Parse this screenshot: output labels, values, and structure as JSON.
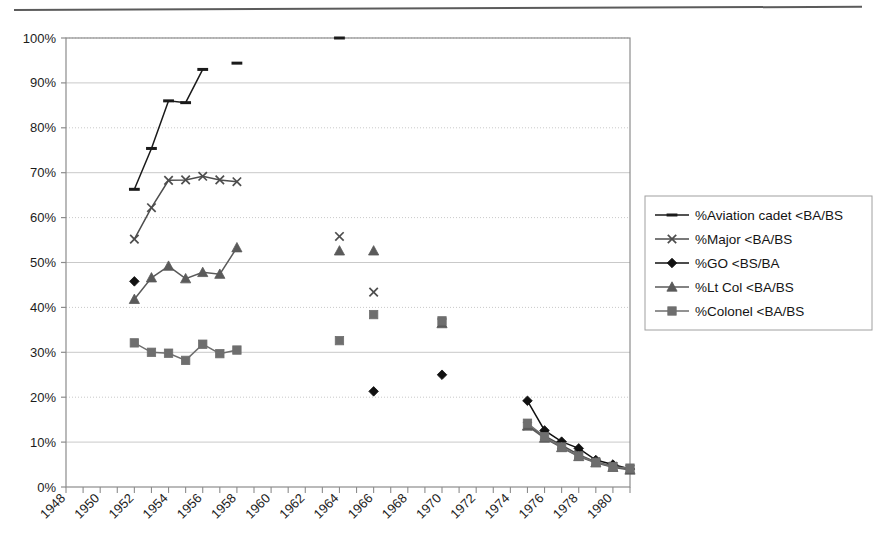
{
  "chart_data": {
    "type": "line",
    "title": "",
    "xlabel": "",
    "ylabel": "",
    "xlim": [
      1948,
      1981
    ],
    "ylim": [
      0,
      1
    ],
    "grid": true,
    "legend_position": "right",
    "y_tick_labels": [
      "100%",
      "90%",
      "80%",
      "70%",
      "60%",
      "50%",
      "40%",
      "30%",
      "20%",
      "10%",
      "0%"
    ],
    "y_tick_values": [
      100,
      90,
      80,
      70,
      60,
      50,
      40,
      30,
      20,
      10,
      0
    ],
    "x_tick_labels": [
      "1948",
      "1950",
      "1952",
      "1954",
      "1956",
      "1958",
      "1960",
      "1962",
      "1964",
      "1966",
      "1968",
      "1970",
      "1972",
      "1974",
      "1976",
      "1978",
      "1980"
    ],
    "x_tick_values": [
      1948,
      1950,
      1952,
      1954,
      1956,
      1958,
      1960,
      1962,
      1964,
      1966,
      1968,
      1970,
      1972,
      1974,
      1976,
      1978,
      1980
    ],
    "series": [
      {
        "name": "%Aviation cadet <BA/BS",
        "marker": "dash",
        "color": "#1a1a1a",
        "segments": [
          [
            {
              "x": 1952,
              "y": 66.3
            },
            {
              "x": 1953,
              "y": 75.4
            },
            {
              "x": 1954,
              "y": 86.0
            },
            {
              "x": 1955,
              "y": 85.6
            },
            {
              "x": 1956,
              "y": 93.0
            }
          ],
          [
            {
              "x": 1958,
              "y": 94.4
            }
          ],
          [
            {
              "x": 1964,
              "y": 100.0
            }
          ]
        ]
      },
      {
        "name": "%Major <BA/BS",
        "marker": "cross",
        "color": "#4d4d4d",
        "segments": [
          [
            {
              "x": 1952,
              "y": 55.2
            },
            {
              "x": 1953,
              "y": 62.2
            },
            {
              "x": 1954,
              "y": 68.3
            },
            {
              "x": 1955,
              "y": 68.4
            },
            {
              "x": 1956,
              "y": 69.2
            },
            {
              "x": 1957,
              "y": 68.4
            },
            {
              "x": 1958,
              "y": 68.0
            }
          ],
          [
            {
              "x": 1964,
              "y": 55.8
            }
          ],
          [
            {
              "x": 1966,
              "y": 43.4
            }
          ],
          [
            {
              "x": 1970,
              "y": 36.6
            }
          ],
          [
            {
              "x": 1975,
              "y": 13.6
            },
            {
              "x": 1976,
              "y": 11.4
            },
            {
              "x": 1977,
              "y": 9.3
            },
            {
              "x": 1978,
              "y": 7.2
            },
            {
              "x": 1979,
              "y": 5.6
            },
            {
              "x": 1980,
              "y": 4.6
            },
            {
              "x": 1981,
              "y": 4.0
            }
          ]
        ]
      },
      {
        "name": "%GO <BS/BA",
        "marker": "diamond",
        "color": "#111111",
        "segments": [
          [
            {
              "x": 1952,
              "y": 45.8
            }
          ],
          [
            {
              "x": 1966,
              "y": 21.3
            }
          ],
          [
            {
              "x": 1970,
              "y": 25.0
            }
          ],
          [
            {
              "x": 1975,
              "y": 19.2
            },
            {
              "x": 1976,
              "y": 12.6
            },
            {
              "x": 1977,
              "y": 10.1
            },
            {
              "x": 1978,
              "y": 8.6
            },
            {
              "x": 1979,
              "y": 6.0
            },
            {
              "x": 1980,
              "y": 5.0
            },
            {
              "x": 1981,
              "y": 4.0
            }
          ]
        ]
      },
      {
        "name": "%Lt Col <BA/BS",
        "marker": "triangle",
        "color": "#5a5a5a",
        "segments": [
          [
            {
              "x": 1952,
              "y": 41.8
            },
            {
              "x": 1953,
              "y": 46.6
            },
            {
              "x": 1954,
              "y": 49.2
            },
            {
              "x": 1955,
              "y": 46.4
            },
            {
              "x": 1956,
              "y": 47.8
            },
            {
              "x": 1957,
              "y": 47.4
            },
            {
              "x": 1958,
              "y": 53.3
            }
          ],
          [
            {
              "x": 1964,
              "y": 52.6
            }
          ],
          [
            {
              "x": 1966,
              "y": 52.6
            }
          ],
          [
            {
              "x": 1970,
              "y": 36.4
            }
          ],
          [
            {
              "x": 1975,
              "y": 13.6
            },
            {
              "x": 1976,
              "y": 10.9
            },
            {
              "x": 1977,
              "y": 8.8
            },
            {
              "x": 1978,
              "y": 6.8
            },
            {
              "x": 1979,
              "y": 5.4
            },
            {
              "x": 1980,
              "y": 4.4
            },
            {
              "x": 1981,
              "y": 3.8
            }
          ]
        ]
      },
      {
        "name": "%Colonel <BA/BS",
        "marker": "square",
        "color": "#6e6e6e",
        "segments": [
          [
            {
              "x": 1952,
              "y": 32.1
            },
            {
              "x": 1953,
              "y": 30.0
            },
            {
              "x": 1954,
              "y": 29.8
            },
            {
              "x": 1955,
              "y": 28.2
            },
            {
              "x": 1956,
              "y": 31.8
            },
            {
              "x": 1957,
              "y": 29.7
            },
            {
              "x": 1958,
              "y": 30.5
            }
          ],
          [
            {
              "x": 1964,
              "y": 32.6
            }
          ],
          [
            {
              "x": 1966,
              "y": 38.4
            }
          ],
          [
            {
              "x": 1970,
              "y": 37.0
            }
          ],
          [
            {
              "x": 1975,
              "y": 14.2
            },
            {
              "x": 1976,
              "y": 11.2
            },
            {
              "x": 1977,
              "y": 8.9
            },
            {
              "x": 1978,
              "y": 6.9
            },
            {
              "x": 1979,
              "y": 5.5
            },
            {
              "x": 1980,
              "y": 4.5
            },
            {
              "x": 1981,
              "y": 4.2
            }
          ]
        ]
      }
    ]
  },
  "legend": {
    "items": [
      {
        "label": "%Aviation cadet <BA/BS"
      },
      {
        "label": "%Major <BA/BS"
      },
      {
        "label": "%GO <BS/BA"
      },
      {
        "label": "%Lt Col <BA/BS"
      },
      {
        "label": "%Colonel <BA/BS"
      }
    ]
  },
  "colors": {
    "plot_border": "#8c8c8c",
    "gridline": "#c9c9c9",
    "background": "#ffffff",
    "rule": "#5b5b5b"
  }
}
